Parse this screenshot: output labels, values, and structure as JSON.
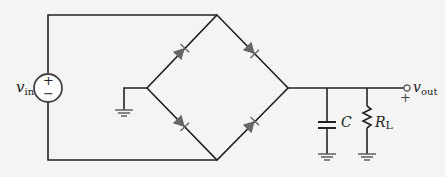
{
  "diagram": {
    "type": "full-wave bridge rectifier with capacitor filter",
    "colors": {
      "wire": "#222222",
      "diode": "#666666",
      "background": "#f4f4f4"
    },
    "labels": {
      "vin": {
        "main": "v",
        "sub": "in"
      },
      "vout": {
        "main": "v",
        "sub": "out"
      },
      "capacitor": "C",
      "resistor": {
        "main": "R",
        "sub": "L"
      },
      "source_plus": "+",
      "source_minus": "−",
      "out_plus": "+"
    },
    "components": [
      "voltage source v_in",
      "diode D1",
      "diode D2",
      "diode D3",
      "diode D4",
      "ground",
      "capacitor C",
      "resistor R_L",
      "output terminal v_out"
    ]
  }
}
